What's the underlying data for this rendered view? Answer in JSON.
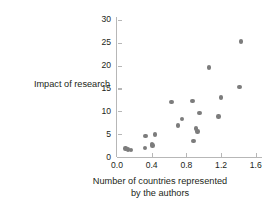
{
  "figure": {
    "name": "scatterplot-impact-vs-countries",
    "background_color": "#ffffff",
    "marker_color": "#7c7c7c",
    "axis_color": "#b7b7b7",
    "text_color": "#231f20"
  },
  "chart_data": {
    "type": "scatter",
    "title": "",
    "xlabel_line1": "Number of countries represented",
    "xlabel_line2": "by the authors",
    "xlabel": "Number of countries represented by the authors",
    "ylabel": "Impact of research",
    "xlim": [
      0.0,
      1.7
    ],
    "ylim": [
      0,
      31
    ],
    "xticks": [
      0.0,
      0.4,
      0.8,
      1.2,
      1.6
    ],
    "xtick_labels": [
      "0.0",
      "0.4",
      "0.8",
      "1.2",
      "1.6"
    ],
    "yticks": [
      0,
      5,
      10,
      15,
      20,
      25,
      30
    ],
    "ytick_labels": [
      "0",
      "5",
      "10",
      "15",
      "20",
      "25",
      "30"
    ],
    "grid": false,
    "legend": null,
    "points": [
      {
        "x": 0.1,
        "y": 1.9
      },
      {
        "x": 0.13,
        "y": 1.6
      },
      {
        "x": 0.16,
        "y": 1.5
      },
      {
        "x": 0.32,
        "y": 2.0
      },
      {
        "x": 0.33,
        "y": 4.6
      },
      {
        "x": 0.4,
        "y": 2.9
      },
      {
        "x": 0.41,
        "y": 2.5
      },
      {
        "x": 0.44,
        "y": 4.9
      },
      {
        "x": 0.63,
        "y": 12.1
      },
      {
        "x": 0.7,
        "y": 6.9
      },
      {
        "x": 0.75,
        "y": 8.3
      },
      {
        "x": 0.87,
        "y": 12.3
      },
      {
        "x": 0.88,
        "y": 3.5
      },
      {
        "x": 0.91,
        "y": 6.2
      },
      {
        "x": 0.93,
        "y": 5.6
      },
      {
        "x": 0.95,
        "y": 9.6
      },
      {
        "x": 1.06,
        "y": 19.6
      },
      {
        "x": 1.17,
        "y": 8.9
      },
      {
        "x": 1.2,
        "y": 13.0
      },
      {
        "x": 1.41,
        "y": 15.3
      },
      {
        "x": 1.43,
        "y": 25.3
      }
    ]
  }
}
